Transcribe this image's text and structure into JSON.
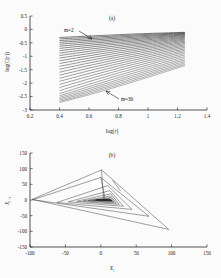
{
  "figure": {
    "background_color": "#fbfbfb",
    "axis_color": "#1b1b1b"
  },
  "panel_a": {
    "label": "(a)",
    "xlabel_main": "log(",
    "xlabel_var": "r",
    "xlabel_close": ")",
    "ylabel": "log(C(r))",
    "annotations": [
      {
        "name": "m-low",
        "text": "m=2"
      },
      {
        "name": "m-high",
        "text": "m=30"
      }
    ],
    "chart_data": {
      "type": "line",
      "title": "(a)",
      "xlabel": "log(r)",
      "ylabel": "log(C(r))",
      "xlim": [
        0.2,
        1.4
      ],
      "ylim": [
        -3,
        0.5
      ],
      "xticks": [
        "0.2",
        "0.4",
        "0.6",
        "0.8",
        "1",
        "1.2",
        "1.4"
      ],
      "xtick_values": [
        0.2,
        0.4,
        0.6,
        0.8,
        1.0,
        1.2,
        1.4
      ],
      "yticks": [
        "0.5",
        "0",
        "-0.5",
        "-1",
        "-1.5",
        "-2",
        "-2.5",
        "-3"
      ],
      "ytick_values": [
        0.5,
        0,
        -0.5,
        -1,
        -1.5,
        -2,
        -2.5,
        -3
      ],
      "grid": false,
      "legend": "none",
      "series_count": 29,
      "embedding_dimension_min": 2,
      "embedding_dimension_max": 30,
      "x_range_data": [
        0.4,
        1.25
      ],
      "description": "Fan of correlation-integral curves log C(r) versus log r for embedding dimensions m = 2 to m = 30; curves shift downward and steepen as m increases.",
      "series": [
        {
          "name": "m=2",
          "x": [
            0.4,
            0.6,
            0.8,
            1.0,
            1.25
          ],
          "values": [
            -0.3,
            -0.248,
            -0.196,
            -0.15,
            -0.108
          ]
        },
        {
          "name": "m=3",
          "x": [
            0.4,
            0.6,
            0.8,
            1.0,
            1.25
          ],
          "values": [
            -0.355,
            -0.296,
            -0.238,
            -0.185,
            -0.128
          ]
        },
        {
          "name": "m=4",
          "x": [
            0.4,
            0.6,
            0.8,
            1.0,
            1.25
          ],
          "values": [
            -0.415,
            -0.348,
            -0.282,
            -0.222,
            -0.15
          ]
        },
        {
          "name": "m=5",
          "x": [
            0.4,
            0.6,
            0.8,
            1.0,
            1.25
          ],
          "values": [
            -0.48,
            -0.403,
            -0.328,
            -0.26,
            -0.174
          ]
        },
        {
          "name": "m=6",
          "x": [
            0.4,
            0.6,
            0.8,
            1.0,
            1.25
          ],
          "values": [
            -0.55,
            -0.462,
            -0.377,
            -0.3,
            -0.2
          ]
        },
        {
          "name": "m=7",
          "x": [
            0.4,
            0.6,
            0.8,
            1.0,
            1.25
          ],
          "values": [
            -0.625,
            -0.525,
            -0.429,
            -0.342,
            -0.228
          ]
        },
        {
          "name": "m=8",
          "x": [
            0.4,
            0.6,
            0.8,
            1.0,
            1.25
          ],
          "values": [
            -0.705,
            -0.592,
            -0.484,
            -0.386,
            -0.258
          ]
        },
        {
          "name": "m=9",
          "x": [
            0.4,
            0.6,
            0.8,
            1.0,
            1.25
          ],
          "values": [
            -0.79,
            -0.663,
            -0.542,
            -0.433,
            -0.29
          ]
        },
        {
          "name": "m=10",
          "x": [
            0.4,
            0.6,
            0.8,
            1.0,
            1.25
          ],
          "values": [
            -0.88,
            -0.738,
            -0.604,
            -0.482,
            -0.324
          ]
        },
        {
          "name": "m=11",
          "x": [
            0.4,
            0.6,
            0.8,
            1.0,
            1.25
          ],
          "values": [
            -0.972,
            -0.816,
            -0.668,
            -0.533,
            -0.36
          ]
        },
        {
          "name": "m=12",
          "x": [
            0.4,
            0.6,
            0.8,
            1.0,
            1.25
          ],
          "values": [
            -1.068,
            -0.897,
            -0.735,
            -0.587,
            -0.398
          ]
        },
        {
          "name": "m=13",
          "x": [
            0.4,
            0.6,
            0.8,
            1.0,
            1.25
          ],
          "values": [
            -1.168,
            -0.981,
            -0.805,
            -0.643,
            -0.438
          ]
        },
        {
          "name": "m=14",
          "x": [
            0.4,
            0.6,
            0.8,
            1.0,
            1.25
          ],
          "values": [
            -1.27,
            -1.068,
            -0.877,
            -0.701,
            -0.48
          ]
        },
        {
          "name": "m=15",
          "x": [
            0.4,
            0.6,
            0.8,
            1.0,
            1.25
          ],
          "values": [
            -1.375,
            -1.158,
            -0.952,
            -0.762,
            -0.524
          ]
        },
        {
          "name": "m=16",
          "x": [
            0.4,
            0.6,
            0.8,
            1.0,
            1.25
          ],
          "values": [
            -1.482,
            -1.25,
            -1.029,
            -0.825,
            -0.57
          ]
        },
        {
          "name": "m=17",
          "x": [
            0.4,
            0.6,
            0.8,
            1.0,
            1.25
          ],
          "values": [
            -1.592,
            -1.344,
            -1.108,
            -0.89,
            -0.618
          ]
        },
        {
          "name": "m=18",
          "x": [
            0.4,
            0.6,
            0.8,
            1.0,
            1.25
          ],
          "values": [
            -1.704,
            -1.44,
            -1.189,
            -0.957,
            -0.668
          ]
        },
        {
          "name": "m=19",
          "x": [
            0.4,
            0.6,
            0.8,
            1.0,
            1.25
          ],
          "values": [
            -1.818,
            -1.538,
            -1.272,
            -1.026,
            -0.72
          ]
        },
        {
          "name": "m=20",
          "x": [
            0.4,
            0.6,
            0.8,
            1.0,
            1.25
          ],
          "values": [
            -1.934,
            -1.638,
            -1.357,
            -1.097,
            -0.774
          ]
        },
        {
          "name": "m=21",
          "x": [
            0.4,
            0.6,
            0.8,
            1.0,
            1.25
          ],
          "values": [
            -2.05,
            -1.739,
            -1.443,
            -1.169,
            -0.83
          ]
        },
        {
          "name": "m=22",
          "x": [
            0.4,
            0.6,
            0.8,
            1.0,
            1.25
          ],
          "values": [
            -2.166,
            -1.841,
            -1.531,
            -1.243,
            -0.888
          ]
        },
        {
          "name": "m=23",
          "x": [
            0.4,
            0.6,
            0.8,
            1.0,
            1.25
          ],
          "values": [
            -2.28,
            -1.943,
            -1.62,
            -1.318,
            -0.948
          ]
        },
        {
          "name": "m=24",
          "x": [
            0.4,
            0.6,
            0.8,
            1.0,
            1.25
          ],
          "values": [
            -2.39,
            -2.044,
            -1.709,
            -1.394,
            -1.01
          ]
        },
        {
          "name": "m=25",
          "x": [
            0.4,
            0.6,
            0.8,
            1.0,
            1.25
          ],
          "values": [
            -2.47,
            -2.13,
            -1.792,
            -1.468,
            -1.072
          ]
        },
        {
          "name": "m=26",
          "x": [
            0.4,
            0.6,
            0.8,
            1.0,
            1.25
          ],
          "values": [
            -2.53,
            -2.203,
            -1.868,
            -1.538,
            -1.132
          ]
        },
        {
          "name": "m=27",
          "x": [
            0.4,
            0.6,
            0.8,
            1.0,
            1.25
          ],
          "values": [
            -2.585,
            -2.268,
            -1.938,
            -1.604,
            -1.19
          ]
        },
        {
          "name": "m=28",
          "x": [
            0.4,
            0.6,
            0.8,
            1.0,
            1.25
          ],
          "values": [
            -2.635,
            -2.328,
            -2.003,
            -1.666,
            -1.245
          ]
        },
        {
          "name": "m=29",
          "x": [
            0.4,
            0.6,
            0.8,
            1.0,
            1.25
          ],
          "values": [
            -2.68,
            -2.383,
            -2.064,
            -1.725,
            -1.298
          ]
        },
        {
          "name": "m=30",
          "x": [
            0.4,
            0.6,
            0.8,
            1.0,
            1.25
          ],
          "values": [
            -2.72,
            -2.434,
            -2.121,
            -1.781,
            -1.348
          ]
        }
      ]
    }
  },
  "panel_b": {
    "label": "(b)",
    "xlabel_var": "X",
    "xlabel_sub": "i",
    "ylabel_var": "X",
    "ylabel_sub": "i+τ",
    "chart_data": {
      "type": "line",
      "title": "(b)",
      "xlabel": "X_i",
      "ylabel": "X_{i+τ}",
      "xlim": [
        -100,
        150
      ],
      "ylim": [
        -150,
        150
      ],
      "xticks": [
        "-100",
        "-50",
        "0",
        "50",
        "100",
        "150"
      ],
      "xtick_values": [
        -100,
        -50,
        0,
        50,
        100,
        150
      ],
      "yticks": [
        "150",
        "100",
        "50",
        "0",
        "-50",
        "-100",
        "-150"
      ],
      "ytick_values": [
        150,
        100,
        50,
        0,
        -50,
        -100,
        -150
      ],
      "grid": false,
      "legend": "none",
      "description": "Reconstructed phase-space attractor (delay embedding). Nested triangular orbits spiralling inward toward a dense dark core near the origin.",
      "orbits": [
        {
          "name": "orbit-1",
          "points": [
            [
              -97,
              2
            ],
            [
              1,
              96
            ],
            [
              96,
              -94
            ],
            [
              -97,
              2
            ]
          ]
        },
        {
          "name": "orbit-2",
          "points": [
            [
              -96,
              1
            ],
            [
              0,
              72
            ],
            [
              68,
              -52
            ],
            [
              -96,
              1
            ]
          ]
        },
        {
          "name": "orbit-3",
          "points": [
            [
              -62,
              -8
            ],
            [
              10,
              46
            ],
            [
              44,
              -30
            ],
            [
              -62,
              -8
            ]
          ]
        },
        {
          "name": "orbit-4",
          "points": [
            [
              -46,
              -6
            ],
            [
              13,
              30
            ],
            [
              32,
              -20
            ],
            [
              -46,
              -6
            ]
          ]
        },
        {
          "name": "orbit-5",
          "points": [
            [
              -34,
              -4
            ],
            [
              14,
              20
            ],
            [
              26,
              -14
            ],
            [
              -34,
              -4
            ]
          ]
        },
        {
          "name": "orbit-6",
          "points": [
            [
              -25,
              -3
            ],
            [
              14,
              13
            ],
            [
              22,
              -10
            ],
            [
              -25,
              -3
            ]
          ]
        },
        {
          "name": "orbit-7",
          "points": [
            [
              -18,
              -2
            ],
            [
              14,
              8
            ],
            [
              19,
              -7
            ],
            [
              -18,
              -2
            ]
          ]
        },
        {
          "name": "orbit-8",
          "points": [
            [
              -13,
              -1
            ],
            [
              13,
              5
            ],
            [
              17,
              -5
            ],
            [
              -13,
              -1
            ]
          ]
        },
        {
          "name": "orbit-9",
          "points": [
            [
              -9,
              -1
            ],
            [
              13,
              3
            ],
            [
              16,
              -3
            ],
            [
              -9,
              -1
            ]
          ]
        },
        {
          "name": "orbit-10",
          "points": [
            [
              -6,
              0
            ],
            [
              12,
              1
            ],
            [
              15,
              -2
            ],
            [
              -6,
              0
            ]
          ]
        }
      ],
      "connector_lines": [
        {
          "name": "spoke-1",
          "points": [
            [
              1,
              96
            ],
            [
              4,
              5
            ]
          ]
        },
        {
          "name": "spoke-2",
          "points": [
            [
              0,
              72
            ],
            [
              6,
              4
            ]
          ]
        },
        {
          "name": "spoke-3",
          "points": [
            [
              17,
              62
            ],
            [
              28,
              28
            ]
          ]
        }
      ]
    }
  }
}
